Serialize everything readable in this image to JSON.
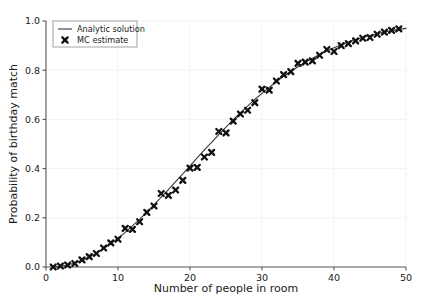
{
  "chart_data": {
    "type": "line",
    "title": "",
    "xlabel": "Number of people in room",
    "ylabel": "Probability of birthday match",
    "xlim": [
      0,
      50
    ],
    "ylim": [
      0.0,
      1.0
    ],
    "xticks": [
      0,
      10,
      20,
      30,
      40,
      50
    ],
    "xtick_labels": [
      "0",
      "10",
      "20",
      "30",
      "40",
      "50"
    ],
    "yticks": [
      0.0,
      0.2,
      0.4,
      0.6,
      0.8,
      1.0
    ],
    "ytick_labels": [
      "0.0",
      "0.2",
      "0.4",
      "0.6",
      "0.8",
      "1.0"
    ],
    "grid": true,
    "legend_position": "upper left",
    "legend_entries": [
      {
        "label": "Analytic solution",
        "marker": "line",
        "color": "#3a3a3a"
      },
      {
        "label": "MC estimate",
        "marker": "x",
        "color": "#111111"
      }
    ],
    "series": [
      {
        "name": "Analytic solution",
        "type": "line",
        "color": "#3a3a3a",
        "x": [
          1,
          2,
          3,
          4,
          5,
          6,
          7,
          8,
          9,
          10,
          11,
          12,
          13,
          14,
          15,
          16,
          17,
          18,
          19,
          20,
          21,
          22,
          23,
          24,
          25,
          26,
          27,
          28,
          29,
          30,
          31,
          32,
          33,
          34,
          35,
          36,
          37,
          38,
          39,
          40,
          41,
          42,
          43,
          44,
          45,
          46,
          47,
          48,
          49,
          50
        ],
        "y": [
          0.0,
          0.003,
          0.008,
          0.016,
          0.027,
          0.04,
          0.056,
          0.074,
          0.095,
          0.117,
          0.141,
          0.167,
          0.194,
          0.223,
          0.253,
          0.284,
          0.315,
          0.347,
          0.379,
          0.411,
          0.444,
          0.476,
          0.507,
          0.538,
          0.569,
          0.598,
          0.627,
          0.654,
          0.681,
          0.706,
          0.73,
          0.753,
          0.775,
          0.795,
          0.814,
          0.832,
          0.849,
          0.864,
          0.878,
          0.891,
          0.903,
          0.914,
          0.924,
          0.933,
          0.941,
          0.948,
          0.955,
          0.961,
          0.966,
          0.97
        ]
      },
      {
        "name": "MC estimate",
        "type": "scatter",
        "marker": "x",
        "color": "#111111",
        "x": [
          1,
          2,
          3,
          4,
          5,
          6,
          7,
          8,
          9,
          10,
          11,
          12,
          13,
          14,
          15,
          16,
          17,
          18,
          19,
          20,
          21,
          22,
          23,
          24,
          25,
          26,
          27,
          28,
          29,
          30,
          31,
          32,
          33,
          34,
          35,
          36,
          37,
          38,
          39,
          40,
          41,
          42,
          43,
          44,
          45,
          46,
          47,
          48,
          49
        ],
        "y": [
          0.0,
          0.004,
          0.008,
          0.014,
          0.029,
          0.042,
          0.055,
          0.077,
          0.098,
          0.113,
          0.157,
          0.153,
          0.184,
          0.222,
          0.248,
          0.299,
          0.291,
          0.313,
          0.352,
          0.402,
          0.405,
          0.447,
          0.466,
          0.551,
          0.545,
          0.593,
          0.622,
          0.637,
          0.668,
          0.723,
          0.719,
          0.756,
          0.782,
          0.794,
          0.828,
          0.833,
          0.838,
          0.861,
          0.884,
          0.876,
          0.9,
          0.908,
          0.919,
          0.93,
          0.933,
          0.946,
          0.955,
          0.962,
          0.968
        ]
      }
    ]
  },
  "axes": {
    "spine_color": "#555555",
    "grid_color": "#f2f2f2",
    "background": "#ffffff"
  }
}
